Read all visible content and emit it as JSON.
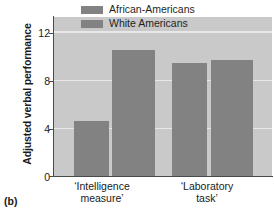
{
  "panel": {
    "tag": "(b)"
  },
  "chart_data": {
    "type": "bar",
    "title": "",
    "subtitle": "",
    "xlabel": "",
    "ylabel": "Adjusted verbal performance",
    "ylim": [
      0,
      13.2
    ],
    "yticks": [
      0,
      4,
      8,
      12
    ],
    "ytick_labels": [
      "0",
      "4",
      "8",
      "12"
    ],
    "grid": true,
    "grid_axis": "y",
    "legend_position": "top-right",
    "categories": [
      "'Intelligence\nmeasure'",
      "'Laboratory\ntask'"
    ],
    "category_labels": [
      {
        "line1": "‘Intelligence",
        "line2": "measure’"
      },
      {
        "line1": "‘Laboratory",
        "line2": "task’"
      }
    ],
    "series": [
      {
        "name": "African-Americans",
        "values": [
          4.6,
          9.4
        ],
        "color": "#828282"
      },
      {
        "name": "White Americans",
        "values": [
          10.5,
          9.6
        ],
        "color": "#828282"
      }
    ],
    "bars": [
      {
        "series": "African-Americans",
        "category": "'Intelligence measure'",
        "value": 4.6
      },
      {
        "series": "White Americans",
        "category": "'Intelligence measure'",
        "value": 10.5
      },
      {
        "series": "African-Americans",
        "category": "'Laboratory task'",
        "value": 9.4
      },
      {
        "series": "White Americans",
        "category": "'Laboratory task'",
        "value": 9.6
      }
    ],
    "colors": {
      "plot_background": "#c9c9c9",
      "bar": "#828282",
      "gridline": "#e8e8e8",
      "axis": "#4a4a4a",
      "text": "#1a1a1a"
    }
  }
}
